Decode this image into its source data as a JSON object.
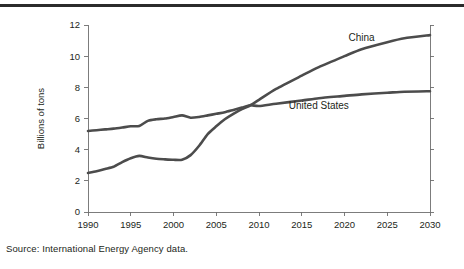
{
  "figure": {
    "source_note": "Source: International Energy Agency data.",
    "line_color": "#4c4c4c",
    "axis_color": "#6e6e6e",
    "rule_color": "#2b2b2b"
  },
  "chart_data": {
    "type": "line",
    "title": "",
    "xlabel": "",
    "ylabel": "Billions of tons",
    "xlim": [
      1990,
      2030
    ],
    "ylim": [
      0,
      12
    ],
    "grid": false,
    "legend_position": "inline-labels",
    "xticks": [
      "1990",
      "1995",
      "2000",
      "2005",
      "2010",
      "2015",
      "2020",
      "2025",
      "2030"
    ],
    "xtick_values": [
      1990,
      1995,
      2000,
      2005,
      2010,
      2015,
      2020,
      2025,
      2030
    ],
    "yticks": [
      "0",
      "2",
      "4",
      "6",
      "8",
      "10",
      "12"
    ],
    "ytick_values": [
      0,
      2,
      4,
      6,
      8,
      10,
      12
    ],
    "x": [
      1990,
      1991,
      1992,
      1993,
      1994,
      1995,
      1996,
      1997,
      1998,
      1999,
      2000,
      2001,
      2002,
      2003,
      2004,
      2005,
      2006,
      2007,
      2008,
      2009,
      2010,
      2012,
      2015,
      2017,
      2020,
      2022,
      2025,
      2027,
      2030
    ],
    "series": [
      {
        "name": "United States",
        "label": "United States",
        "label_x": 2017,
        "label_y": 6.6,
        "values": [
          5.2,
          5.25,
          5.3,
          5.35,
          5.42,
          5.5,
          5.52,
          5.85,
          5.95,
          6.0,
          6.1,
          6.2,
          6.05,
          6.1,
          6.2,
          6.3,
          6.4,
          6.55,
          6.7,
          6.85,
          6.8,
          6.95,
          7.15,
          7.3,
          7.45,
          7.55,
          7.65,
          7.72,
          7.75
        ]
      },
      {
        "name": "China",
        "label": "China",
        "label_x": 2022,
        "label_y": 10.95,
        "values": [
          2.5,
          2.62,
          2.76,
          2.9,
          3.2,
          3.45,
          3.6,
          3.5,
          3.42,
          3.38,
          3.35,
          3.35,
          3.65,
          4.25,
          5.0,
          5.5,
          5.95,
          6.3,
          6.6,
          6.85,
          7.2,
          7.9,
          8.75,
          9.3,
          10.0,
          10.45,
          10.9,
          11.15,
          11.35
        ]
      }
    ]
  }
}
